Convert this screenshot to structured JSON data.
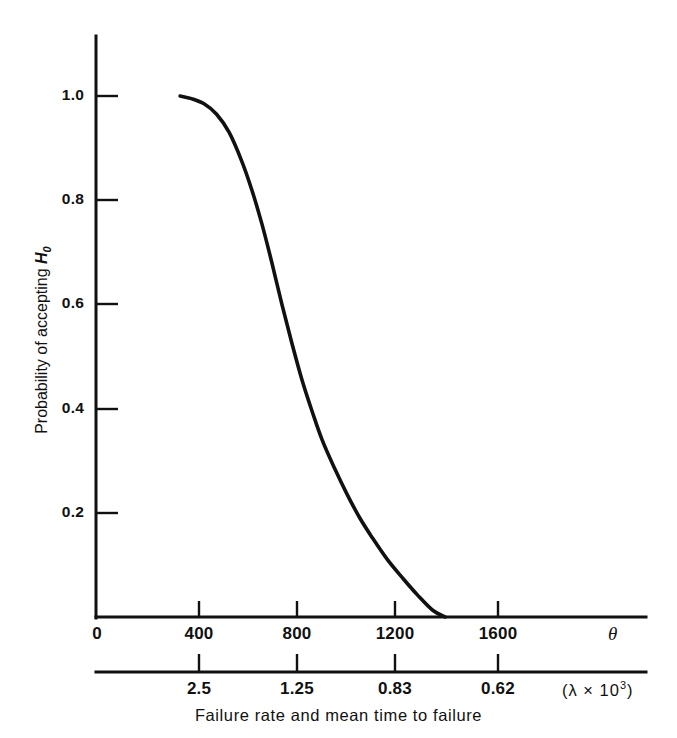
{
  "figure": {
    "caption": "Failure rate and mean time to failure",
    "y_axis_title_prefix": "Probability of accepting ",
    "y_axis_title_var": "H",
    "y_axis_title_sub": "0",
    "theta_symbol": "θ",
    "lambda_prefix": "(λ  ×  10",
    "lambda_exp": "3",
    "lambda_suffix": ")",
    "line_color": "#111111",
    "background_color": "#ffffff"
  },
  "chart_data": {
    "type": "line",
    "title": "",
    "subtitle": "",
    "xlabel": "Failure rate and mean time to failure",
    "ylabel": "Probability of accepting H0",
    "grid": false,
    "legend": "none",
    "xlim": [
      0,
      2240
    ],
    "ylim": [
      0,
      1.0
    ],
    "x_tick_labels": [
      "0",
      "400",
      "800",
      "1200",
      "1600"
    ],
    "x_tick_values": [
      0,
      400,
      800,
      1200,
      1600
    ],
    "x_axis_symbol": "θ",
    "secondary_axis": {
      "name": "failure rate lambda",
      "tick_labels": [
        "2.5",
        "1.25",
        "0.83",
        "0.62"
      ],
      "tick_values": [
        2.5,
        1.25,
        0.83,
        0.62
      ],
      "tick_positions_theta": [
        400,
        800,
        1200,
        1600
      ],
      "unit_label": "(λ × 10^3)"
    },
    "y_tick_labels": [
      "0.2",
      "0.4",
      "0.6",
      "0.8",
      "1.0"
    ],
    "y_tick_values": [
      0.2,
      0.4,
      0.6,
      0.8,
      1.0
    ],
    "series": [
      {
        "name": "Operating characteristic curve",
        "x": [
          335,
          380,
          430,
          480,
          530,
          580,
          620,
          660,
          700,
          740,
          780,
          820,
          860,
          900,
          950,
          1000,
          1050,
          1100,
          1160,
          1220,
          1280,
          1340,
          1390
        ],
        "y": [
          1.0,
          0.995,
          0.985,
          0.965,
          0.93,
          0.875,
          0.82,
          0.755,
          0.68,
          0.6,
          0.525,
          0.455,
          0.395,
          0.34,
          0.285,
          0.235,
          0.19,
          0.152,
          0.11,
          0.075,
          0.042,
          0.013,
          0.0
        ]
      }
    ]
  }
}
